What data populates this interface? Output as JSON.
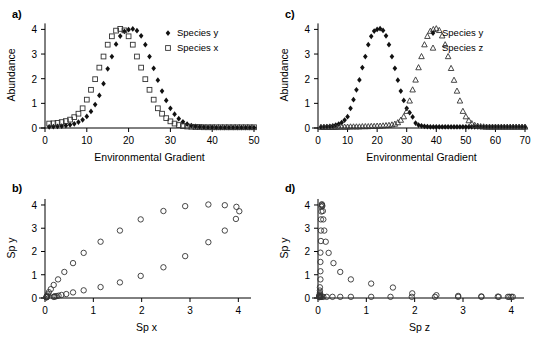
{
  "figure": {
    "panels": [
      {
        "id": "a",
        "label": "a)"
      },
      {
        "id": "b",
        "label": "b)"
      },
      {
        "id": "c",
        "label": "c)"
      },
      {
        "id": "d",
        "label": "d)"
      }
    ]
  },
  "chart_data": [
    {
      "panel": "a",
      "type": "scatter",
      "title": "",
      "xlabel": "Environmental Gradient",
      "ylabel": "Abundance",
      "xlim": [
        0,
        50
      ],
      "ylim": [
        0,
        4.3
      ],
      "xticks": [
        0,
        10,
        20,
        30,
        40,
        50
      ],
      "yticks": [
        0,
        1,
        2,
        3,
        4
      ],
      "grid": false,
      "legend_position": "right",
      "series": [
        {
          "name": "Species y",
          "marker": "filled-diamond",
          "color": "#111111",
          "x": [
            1,
            2,
            3,
            4,
            5,
            6,
            7,
            8,
            9,
            10,
            11,
            12,
            13,
            14,
            15,
            16,
            17,
            18,
            19,
            20,
            21,
            22,
            23,
            24,
            25,
            26,
            27,
            28,
            29,
            30,
            31,
            32,
            33,
            34,
            35,
            36,
            37,
            38,
            39,
            40,
            41,
            42,
            43,
            44,
            45,
            46,
            47,
            48,
            49,
            50
          ],
          "y": [
            0.05,
            0.06,
            0.07,
            0.08,
            0.1,
            0.13,
            0.17,
            0.24,
            0.33,
            0.47,
            0.67,
            0.95,
            1.32,
            1.8,
            2.4,
            2.9,
            3.4,
            3.73,
            3.92,
            3.99,
            4.02,
            3.95,
            3.74,
            3.38,
            2.9,
            2.42,
            1.94,
            1.5,
            1.12,
            0.8,
            0.56,
            0.38,
            0.25,
            0.16,
            0.1,
            0.07,
            0.05,
            0.04,
            0.03,
            0.03,
            0.02,
            0.02,
            0.02,
            0.02,
            0.02,
            0.02,
            0.02,
            0.02,
            0.02,
            0.02
          ]
        },
        {
          "name": "Species x",
          "marker": "open-square",
          "color": "#333333",
          "x": [
            1,
            2,
            3,
            4,
            5,
            6,
            7,
            8,
            9,
            10,
            11,
            12,
            13,
            14,
            15,
            16,
            17,
            18,
            19,
            20,
            21,
            22,
            23,
            24,
            25,
            26,
            27,
            28,
            29,
            30,
            31,
            32,
            33,
            34,
            35,
            36,
            37,
            38,
            39,
            40,
            41,
            42,
            43,
            44,
            45,
            46,
            47,
            48,
            49,
            50
          ],
          "y": [
            0.18,
            0.19,
            0.21,
            0.24,
            0.28,
            0.34,
            0.44,
            0.58,
            0.8,
            1.15,
            1.55,
            1.98,
            2.45,
            2.9,
            3.38,
            3.72,
            3.95,
            4.02,
            3.96,
            3.72,
            3.38,
            2.9,
            2.45,
            1.98,
            1.55,
            1.15,
            0.8,
            0.58,
            0.4,
            0.27,
            0.18,
            0.12,
            0.08,
            0.06,
            0.05,
            0.04,
            0.04,
            0.03,
            0.03,
            0.03,
            0.03,
            0.03,
            0.03,
            0.03,
            0.03,
            0.03,
            0.03,
            0.03,
            0.03,
            0.03
          ]
        }
      ]
    },
    {
      "panel": "b",
      "type": "scatter",
      "title": "",
      "xlabel": "Sp x",
      "ylabel": "Sp y",
      "xlim": [
        0,
        4.2
      ],
      "ylim": [
        0,
        4.3
      ],
      "xticks": [
        0,
        1,
        2,
        3,
        4
      ],
      "yticks": [
        0,
        1,
        2,
        3,
        4
      ],
      "grid": false,
      "legend_position": "none",
      "series": [
        {
          "name": "Sp y vs Sp x",
          "marker": "open-circle",
          "color": "#333333",
          "x": [
            0.18,
            0.19,
            0.21,
            0.24,
            0.28,
            0.34,
            0.44,
            0.58,
            0.8,
            1.15,
            1.55,
            1.98,
            2.45,
            2.9,
            3.38,
            3.72,
            3.95,
            4.02,
            3.96,
            3.72,
            3.38,
            2.9,
            2.45,
            1.98,
            1.55,
            1.15,
            0.8,
            0.58,
            0.4,
            0.27,
            0.18,
            0.12,
            0.08,
            0.06,
            0.05,
            0.04,
            0.04,
            0.03,
            0.03,
            0.03
          ],
          "y": [
            0.05,
            0.06,
            0.07,
            0.08,
            0.1,
            0.13,
            0.17,
            0.24,
            0.33,
            0.47,
            0.67,
            0.95,
            1.32,
            1.8,
            2.4,
            2.9,
            3.4,
            3.73,
            3.92,
            3.99,
            4.02,
            3.95,
            3.74,
            3.38,
            2.9,
            2.42,
            1.94,
            1.5,
            1.12,
            0.8,
            0.56,
            0.38,
            0.25,
            0.16,
            0.1,
            0.07,
            0.05,
            0.04,
            0.03,
            0.03
          ]
        }
      ]
    },
    {
      "panel": "c",
      "type": "scatter",
      "title": "",
      "xlabel": "Environmental Gradient",
      "ylabel": "Abundance",
      "xlim": [
        0,
        70
      ],
      "ylim": [
        0,
        4.3
      ],
      "xticks": [
        0,
        10,
        20,
        30,
        40,
        50,
        60,
        70
      ],
      "yticks": [
        0,
        1,
        2,
        3,
        4
      ],
      "grid": false,
      "legend_position": "right",
      "series": [
        {
          "name": "Species y",
          "marker": "filled-diamond",
          "color": "#111111",
          "x": [
            1,
            2,
            3,
            4,
            5,
            6,
            7,
            8,
            9,
            10,
            11,
            12,
            13,
            14,
            15,
            16,
            17,
            18,
            19,
            20,
            21,
            22,
            23,
            24,
            25,
            26,
            27,
            28,
            29,
            30,
            31,
            32,
            33,
            34,
            35,
            36,
            37,
            38,
            39,
            40,
            41,
            42,
            43,
            44,
            45,
            46,
            47,
            48,
            49,
            50,
            51,
            52,
            53,
            54,
            55,
            56,
            57,
            58,
            59,
            60,
            61,
            62,
            63,
            64,
            65,
            66,
            67,
            68,
            69,
            70
          ],
          "y": [
            0.04,
            0.05,
            0.06,
            0.07,
            0.09,
            0.12,
            0.16,
            0.22,
            0.32,
            0.46,
            0.8,
            1.15,
            1.55,
            1.95,
            2.45,
            2.9,
            3.38,
            3.72,
            3.93,
            4.0,
            4.03,
            3.96,
            3.74,
            3.38,
            2.9,
            2.42,
            1.94,
            1.5,
            1.12,
            0.8,
            0.62,
            0.45,
            0.2,
            0.12,
            0.09,
            0.07,
            0.06,
            0.05,
            0.05,
            0.05,
            0.05,
            0.05,
            0.05,
            0.05,
            0.05,
            0.05,
            0.05,
            0.05,
            0.05,
            0.05,
            0.05,
            0.05,
            0.05,
            0.05,
            0.05,
            0.05,
            0.05,
            0.05,
            0.05,
            0.05,
            0.05,
            0.05,
            0.05,
            0.05,
            0.05,
            0.05,
            0.05,
            0.05,
            0.05,
            0.05
          ]
        },
        {
          "name": "Species z",
          "marker": "open-triangle",
          "color": "#444444",
          "x": [
            1,
            2,
            3,
            4,
            5,
            6,
            7,
            8,
            9,
            10,
            11,
            12,
            13,
            14,
            15,
            16,
            17,
            18,
            19,
            20,
            21,
            22,
            23,
            24,
            25,
            26,
            27,
            28,
            29,
            30,
            31,
            32,
            33,
            34,
            35,
            36,
            37,
            38,
            39,
            40,
            41,
            42,
            43,
            44,
            45,
            46,
            47,
            48,
            49,
            50,
            51,
            52,
            53,
            54,
            55,
            56,
            57,
            58,
            59,
            60,
            61,
            62,
            63,
            64,
            65,
            66,
            67,
            68,
            69,
            70
          ],
          "y": [
            0.03,
            0.03,
            0.03,
            0.03,
            0.03,
            0.03,
            0.04,
            0.04,
            0.04,
            0.04,
            0.05,
            0.05,
            0.05,
            0.05,
            0.06,
            0.06,
            0.06,
            0.07,
            0.07,
            0.08,
            0.08,
            0.09,
            0.1,
            0.11,
            0.13,
            0.16,
            0.22,
            0.32,
            0.46,
            0.68,
            1.1,
            1.55,
            1.95,
            2.45,
            2.9,
            3.38,
            3.72,
            3.93,
            4.0,
            4.03,
            3.96,
            3.74,
            3.38,
            2.9,
            2.42,
            1.94,
            1.5,
            1.1,
            0.68,
            0.46,
            0.3,
            0.18,
            0.11,
            0.08,
            0.06,
            0.05,
            0.04,
            0.04,
            0.04,
            0.04,
            0.04,
            0.04,
            0.04,
            0.04,
            0.04,
            0.04,
            0.04,
            0.04,
            0.04,
            0.04
          ]
        }
      ]
    },
    {
      "panel": "d",
      "type": "scatter",
      "title": "",
      "xlabel": "Sp z",
      "ylabel": "Sp y",
      "xlim": [
        0,
        4.2
      ],
      "ylim": [
        0,
        4.3
      ],
      "xticks": [
        0,
        1,
        2,
        3,
        4
      ],
      "yticks": [
        0,
        1,
        2,
        3,
        4
      ],
      "grid": false,
      "legend_position": "none",
      "series": [
        {
          "name": "Sp y vs Sp z",
          "marker": "open-circle",
          "color": "#333333",
          "x": [
            0.03,
            0.03,
            0.03,
            0.03,
            0.03,
            0.03,
            0.04,
            0.04,
            0.04,
            0.04,
            0.05,
            0.05,
            0.05,
            0.05,
            0.06,
            0.06,
            0.06,
            0.07,
            0.07,
            0.08,
            0.08,
            0.09,
            0.1,
            0.11,
            0.13,
            0.16,
            0.22,
            0.32,
            0.46,
            0.68,
            1.1,
            1.55,
            1.95,
            2.45,
            2.9,
            3.38,
            3.72,
            3.93,
            4.0,
            4.03,
            3.96,
            3.74,
            3.38,
            2.9,
            2.42,
            1.94,
            1.5,
            1.1,
            0.68,
            0.46,
            0.3,
            0.18,
            0.11,
            0.08,
            0.06,
            0.05,
            0.04,
            0.04,
            0.04,
            0.04
          ],
          "y": [
            0.04,
            0.05,
            0.06,
            0.07,
            0.09,
            0.12,
            0.16,
            0.22,
            0.32,
            0.46,
            0.8,
            1.15,
            1.55,
            1.95,
            2.45,
            2.9,
            3.38,
            3.72,
            3.93,
            4.0,
            4.03,
            3.96,
            3.74,
            3.38,
            2.9,
            2.42,
            1.94,
            1.5,
            1.12,
            0.8,
            0.62,
            0.45,
            0.2,
            0.12,
            0.09,
            0.07,
            0.06,
            0.05,
            0.05,
            0.05,
            0.05,
            0.05,
            0.05,
            0.05,
            0.05,
            0.05,
            0.05,
            0.05,
            0.05,
            0.05,
            0.05,
            0.05,
            0.05,
            0.05,
            0.05,
            0.05,
            0.05,
            0.05,
            0.05,
            0.05
          ]
        }
      ]
    }
  ]
}
